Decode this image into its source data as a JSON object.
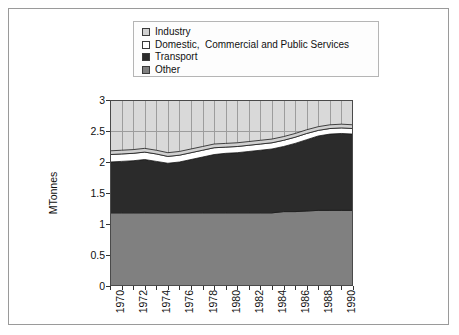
{
  "legend": {
    "items": [
      {
        "label": "Industry",
        "swatch": "#d0d0d0"
      },
      {
        "label": "Domestic,  Commercial and Public Services",
        "swatch": "#ffffff"
      },
      {
        "label": "Transport",
        "swatch": "#2b2b2b"
      },
      {
        "label": "Other",
        "swatch": "#808080"
      }
    ]
  },
  "chart_data": {
    "type": "area",
    "title": "",
    "xlabel": "",
    "ylabel": "MTonnes",
    "stacked": true,
    "grid": true,
    "legend_position": "top",
    "xlim": [
      1970,
      1991
    ],
    "ylim": [
      0,
      3
    ],
    "yticks": [
      "0",
      "0.5",
      "1",
      "1.5",
      "2",
      "2.5",
      "3"
    ],
    "ytick_values": [
      0,
      0.5,
      1,
      1.5,
      2,
      2.5,
      3
    ],
    "x": [
      1970,
      1971,
      1972,
      1973,
      1974,
      1975,
      1976,
      1977,
      1978,
      1979,
      1980,
      1981,
      1982,
      1983,
      1984,
      1985,
      1986,
      1987,
      1988,
      1989,
      1990,
      1991
    ],
    "xtick_labels": [
      "1970",
      "1972",
      "1974",
      "1976",
      "1978",
      "1980",
      "1982",
      "1984",
      "1986",
      "1988",
      "1990"
    ],
    "xtick_values": [
      1970,
      1972,
      1974,
      1976,
      1978,
      1980,
      1982,
      1984,
      1986,
      1988,
      1990
    ],
    "series": [
      {
        "name": "Other",
        "color": "#808080",
        "values": [
          1.18,
          1.18,
          1.18,
          1.18,
          1.18,
          1.18,
          1.18,
          1.18,
          1.18,
          1.18,
          1.18,
          1.18,
          1.18,
          1.18,
          1.18,
          1.2,
          1.2,
          1.21,
          1.22,
          1.22,
          1.22,
          1.22
        ]
      },
      {
        "name": "Transport",
        "color": "#2b2b2b",
        "values": [
          0.82,
          0.83,
          0.84,
          0.86,
          0.83,
          0.8,
          0.82,
          0.86,
          0.9,
          0.94,
          0.96,
          0.97,
          0.99,
          1.01,
          1.03,
          1.05,
          1.1,
          1.15,
          1.2,
          1.23,
          1.24,
          1.23
        ]
      },
      {
        "name": "Domestic,  Commercial and Public Services",
        "color": "#ffffff",
        "values": [
          0.12,
          0.12,
          0.12,
          0.12,
          0.12,
          0.11,
          0.11,
          0.11,
          0.11,
          0.11,
          0.1,
          0.1,
          0.1,
          0.1,
          0.1,
          0.1,
          0.1,
          0.1,
          0.09,
          0.09,
          0.09,
          0.09
        ]
      },
      {
        "name": "Industry",
        "color": "#d0d0d0",
        "values": [
          0.06,
          0.06,
          0.06,
          0.06,
          0.06,
          0.06,
          0.06,
          0.06,
          0.06,
          0.06,
          0.06,
          0.06,
          0.06,
          0.06,
          0.06,
          0.06,
          0.06,
          0.06,
          0.06,
          0.06,
          0.06,
          0.06
        ]
      }
    ],
    "totals": [
      2.18,
      2.19,
      2.2,
      2.22,
      2.19,
      2.15,
      2.17,
      2.21,
      2.25,
      2.29,
      2.3,
      2.31,
      2.33,
      2.35,
      2.37,
      2.41,
      2.46,
      2.52,
      2.57,
      2.6,
      2.61,
      2.6
    ]
  }
}
